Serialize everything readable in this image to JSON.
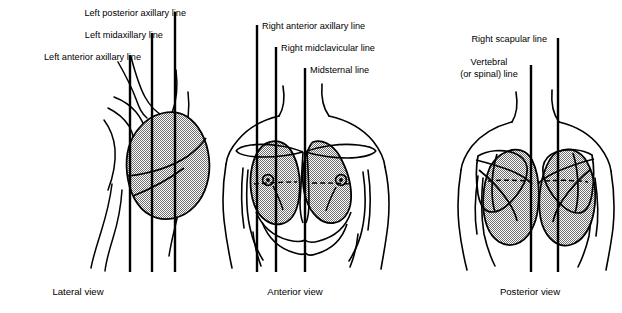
{
  "figure": {
    "stroke_color": "#000000",
    "hatch_color": "#8c8c8c",
    "background": "#ffffff"
  },
  "panels": [
    {
      "id": "lateral",
      "caption": "Lateral view",
      "caption_x": 78,
      "caption_y": 292,
      "labels": [
        {
          "text": "Left posterior axillary line",
          "x": 186,
          "y": 8,
          "align": "right",
          "line_x": 175,
          "line_top": 12,
          "line_bottom": 272
        },
        {
          "text": "Left midaxillary line",
          "x": 163,
          "y": 30,
          "align": "right",
          "line_x": 152,
          "line_top": 33,
          "line_bottom": 272
        },
        {
          "text": "Left anterior axillary line",
          "x": 141,
          "y": 52,
          "align": "right",
          "line_x": 130,
          "line_top": 55,
          "line_bottom": 272
        }
      ]
    },
    {
      "id": "anterior",
      "caption": "Anterior view",
      "caption_x": 295,
      "caption_y": 292,
      "labels": [
        {
          "text": "Right anterior axillary line",
          "x": 262,
          "y": 21,
          "align": "left",
          "line_x": 257,
          "line_top": 25,
          "line_bottom": 272
        },
        {
          "text": "Right midclavicular line",
          "x": 281,
          "y": 43,
          "align": "left",
          "line_x": 276,
          "line_top": 47,
          "line_bottom": 272
        },
        {
          "text": "Midsternal line",
          "x": 310,
          "y": 65,
          "align": "left",
          "line_x": 305,
          "line_top": 68,
          "line_bottom": 272
        }
      ]
    },
    {
      "id": "posterior",
      "caption": "Posterior view",
      "caption_x": 530,
      "caption_y": 292,
      "labels": [
        {
          "text": "Right scapular line",
          "x": 552,
          "y": 34,
          "align": "right",
          "line_x": 558,
          "line_top": 38,
          "line_bottom": 272
        },
        {
          "text": "Vertebral",
          "x": 489,
          "y": 57,
          "align": "center",
          "line_x": 531,
          "line_top": 65,
          "line_bottom": 272
        },
        {
          "text": "(or spinal) line",
          "x": 489,
          "y": 69,
          "align": "center"
        }
      ]
    }
  ]
}
